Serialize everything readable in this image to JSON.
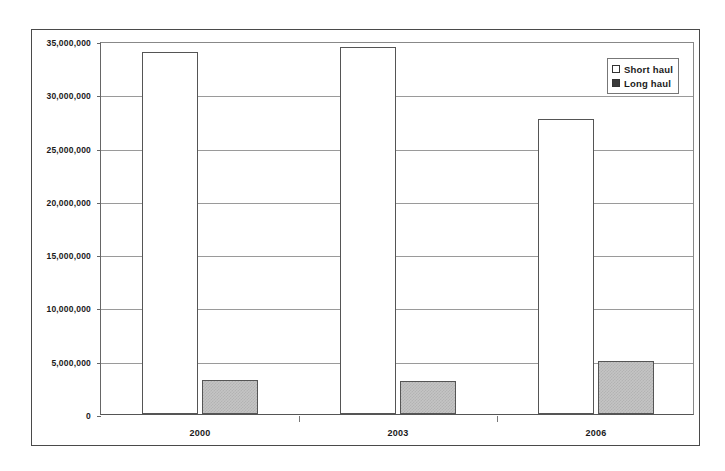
{
  "chart_data": {
    "type": "bar",
    "title": "",
    "subtitle": "",
    "xlabel": "",
    "ylabel": "",
    "categories": [
      "2000",
      "2003",
      "2006"
    ],
    "series": [
      {
        "name": "Short haul",
        "values": [
          34000000,
          34400000,
          27700000
        ],
        "color": "#ffffff"
      },
      {
        "name": "Long haul",
        "values": [
          3200000,
          3100000,
          4950000
        ],
        "color": "#c4c4c4"
      }
    ],
    "ylim": [
      0,
      35000000
    ],
    "ytick_values": [
      0,
      5000000,
      10000000,
      15000000,
      20000000,
      25000000,
      30000000,
      35000000
    ],
    "ytick_labels": [
      "0",
      "5,000,000",
      "10,000,000",
      "15,000,000",
      "20,000,000",
      "25,000,000",
      "30,000,000",
      "35,000,000"
    ],
    "grid": true,
    "legend_position": "top-right",
    "legend_entries": [
      {
        "label": "Short haul",
        "swatch": "open-square-icon"
      },
      {
        "label": "Long haul",
        "swatch": "filled-square-icon"
      }
    ]
  }
}
